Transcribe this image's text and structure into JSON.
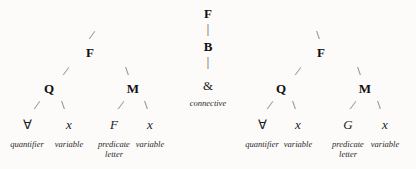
{
  "diagram": {
    "background_color": "#fcfbfa",
    "ink_color": "#111111",
    "connective_symbol": "&",
    "universal_quantifier_symbol": "∀"
  },
  "root": {
    "label": "F"
  },
  "connective_spine": {
    "top": "F",
    "middle": "B",
    "terminal": "&",
    "gloss": "connective"
  },
  "left_subtree": {
    "root": "F",
    "quantifier_phrase": {
      "node": "Q",
      "leaves": [
        {
          "symbol": "∀",
          "gloss": "quantifier"
        },
        {
          "symbol": "x",
          "gloss": "variable"
        }
      ]
    },
    "matrix_phrase": {
      "node": "M",
      "leaves": [
        {
          "symbol": "F",
          "gloss": "predicate letter"
        },
        {
          "symbol": "x",
          "gloss": "variable"
        }
      ]
    }
  },
  "right_subtree": {
    "root": "F",
    "quantifier_phrase": {
      "node": "Q",
      "leaves": [
        {
          "symbol": "∀",
          "gloss": "quantifier"
        },
        {
          "symbol": "x",
          "gloss": "variable"
        }
      ]
    },
    "matrix_phrase": {
      "node": "M",
      "leaves": [
        {
          "symbol": "G",
          "gloss": "predicate letter"
        },
        {
          "symbol": "x",
          "gloss": "variable"
        }
      ]
    }
  },
  "glosses": {
    "quantifier": "quantifier",
    "variable": "variable",
    "predicate_line1": "predicate",
    "predicate_line2": "letter",
    "connective": "connective"
  }
}
